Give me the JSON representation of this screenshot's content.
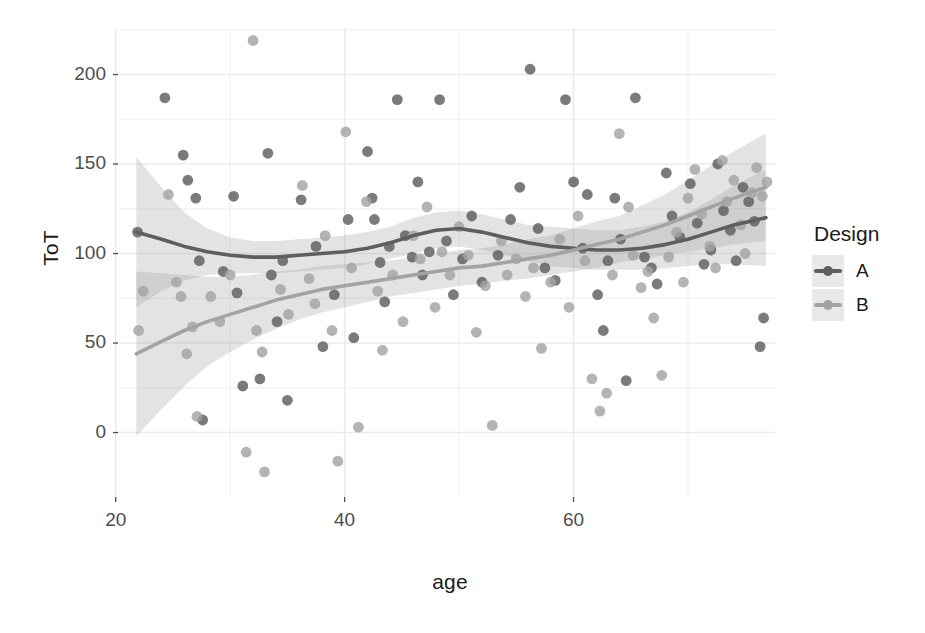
{
  "chart": {
    "type": "scatter",
    "title": "",
    "xlabel": "age",
    "ylabel": "ToT",
    "legend_title": "Design",
    "legend_position": "right",
    "grid": true,
    "panel_background": "#ffffff",
    "grid_color": "#ebebeb",
    "xticks": [
      "20",
      "40",
      "60"
    ],
    "xtick_values": [
      20,
      40,
      60
    ],
    "yticks": [
      "0",
      "50",
      "100",
      "150",
      "200"
    ],
    "ytick_values": [
      0,
      50,
      100,
      150,
      200
    ],
    "xlim": [
      20.2,
      77.6
    ],
    "ylim": [
      -36,
      226
    ],
    "series": [
      {
        "name": "A",
        "color": "#5e5e5e",
        "smooth": [
          [
            21.8,
            112
          ],
          [
            24,
            108
          ],
          [
            26,
            104
          ],
          [
            28,
            101
          ],
          [
            30,
            99
          ],
          [
            32,
            98
          ],
          [
            34,
            98
          ],
          [
            36,
            99
          ],
          [
            38,
            100
          ],
          [
            40,
            101
          ],
          [
            42,
            103
          ],
          [
            44,
            106
          ],
          [
            46,
            110
          ],
          [
            48,
            113
          ],
          [
            50,
            114
          ],
          [
            52,
            112
          ],
          [
            54,
            109
          ],
          [
            56,
            106
          ],
          [
            58,
            104
          ],
          [
            60,
            103
          ],
          [
            62,
            102
          ],
          [
            64,
            102
          ],
          [
            66,
            103
          ],
          [
            68,
            105
          ],
          [
            70,
            108
          ],
          [
            72,
            112
          ],
          [
            74,
            116
          ],
          [
            76.8,
            120
          ]
        ],
        "ci_low": [
          [
            21.8,
            70
          ],
          [
            24,
            79
          ],
          [
            26,
            85
          ],
          [
            28,
            88
          ],
          [
            30,
            89
          ],
          [
            32,
            89
          ],
          [
            34,
            89
          ],
          [
            36,
            90
          ],
          [
            38,
            91
          ],
          [
            40,
            92
          ],
          [
            42,
            94
          ],
          [
            44,
            97
          ],
          [
            46,
            100
          ],
          [
            48,
            103
          ],
          [
            50,
            104
          ],
          [
            52,
            102
          ],
          [
            54,
            99
          ],
          [
            56,
            96
          ],
          [
            58,
            93
          ],
          [
            60,
            92
          ],
          [
            62,
            91
          ],
          [
            64,
            91
          ],
          [
            66,
            91
          ],
          [
            68,
            92
          ],
          [
            70,
            93
          ],
          [
            72,
            94
          ],
          [
            74,
            94
          ],
          [
            76.8,
            93
          ]
        ],
        "ci_high": [
          [
            21.8,
            154
          ],
          [
            24,
            137
          ],
          [
            26,
            123
          ],
          [
            28,
            114
          ],
          [
            30,
            109
          ],
          [
            32,
            107
          ],
          [
            34,
            107
          ],
          [
            36,
            108
          ],
          [
            38,
            109
          ],
          [
            40,
            110
          ],
          [
            42,
            112
          ],
          [
            44,
            115
          ],
          [
            46,
            120
          ],
          [
            48,
            123
          ],
          [
            50,
            124
          ],
          [
            52,
            122
          ],
          [
            54,
            119
          ],
          [
            56,
            116
          ],
          [
            58,
            115
          ],
          [
            60,
            114
          ],
          [
            62,
            113
          ],
          [
            64,
            113
          ],
          [
            66,
            115
          ],
          [
            68,
            118
          ],
          [
            70,
            123
          ],
          [
            72,
            130
          ],
          [
            74,
            138
          ],
          [
            76.8,
            147
          ]
        ]
      },
      {
        "name": "B",
        "color": "#a3a3a3",
        "smooth": [
          [
            21.8,
            44
          ],
          [
            24,
            51
          ],
          [
            26,
            57
          ],
          [
            28,
            62
          ],
          [
            30,
            66
          ],
          [
            32,
            70
          ],
          [
            34,
            74
          ],
          [
            36,
            77
          ],
          [
            38,
            80
          ],
          [
            40,
            82
          ],
          [
            42,
            84
          ],
          [
            44,
            86
          ],
          [
            46,
            88
          ],
          [
            48,
            90
          ],
          [
            50,
            92
          ],
          [
            52,
            93
          ],
          [
            54,
            95
          ],
          [
            56,
            97
          ],
          [
            58,
            99
          ],
          [
            60,
            102
          ],
          [
            62,
            105
          ],
          [
            64,
            108
          ],
          [
            66,
            112
          ],
          [
            68,
            116
          ],
          [
            70,
            121
          ],
          [
            72,
            126
          ],
          [
            74,
            131
          ],
          [
            76.8,
            137
          ]
        ],
        "ci_low": [
          [
            21.8,
            -2
          ],
          [
            24,
            13
          ],
          [
            26,
            26
          ],
          [
            28,
            37
          ],
          [
            30,
            45
          ],
          [
            32,
            52
          ],
          [
            34,
            58
          ],
          [
            36,
            63
          ],
          [
            38,
            67
          ],
          [
            40,
            70
          ],
          [
            42,
            73
          ],
          [
            44,
            76
          ],
          [
            46,
            78
          ],
          [
            48,
            80
          ],
          [
            50,
            82
          ],
          [
            52,
            83
          ],
          [
            54,
            85
          ],
          [
            56,
            86
          ],
          [
            58,
            88
          ],
          [
            60,
            90
          ],
          [
            62,
            92
          ],
          [
            64,
            95
          ],
          [
            66,
            97
          ],
          [
            68,
            99
          ],
          [
            70,
            101
          ],
          [
            72,
            103
          ],
          [
            74,
            105
          ],
          [
            76.8,
            107
          ]
        ],
        "ci_high": [
          [
            21.8,
            90
          ],
          [
            24,
            89
          ],
          [
            26,
            88
          ],
          [
            28,
            87
          ],
          [
            30,
            87
          ],
          [
            32,
            88
          ],
          [
            34,
            90
          ],
          [
            36,
            91
          ],
          [
            38,
            93
          ],
          [
            40,
            94
          ],
          [
            42,
            95
          ],
          [
            44,
            96
          ],
          [
            46,
            98
          ],
          [
            48,
            100
          ],
          [
            50,
            102
          ],
          [
            52,
            103
          ],
          [
            54,
            105
          ],
          [
            56,
            108
          ],
          [
            58,
            110
          ],
          [
            60,
            114
          ],
          [
            62,
            118
          ],
          [
            64,
            121
          ],
          [
            66,
            127
          ],
          [
            68,
            133
          ],
          [
            70,
            141
          ],
          [
            72,
            149
          ],
          [
            74,
            157
          ],
          [
            76.8,
            167
          ]
        ]
      }
    ],
    "points_A": [
      [
        21.9,
        112
      ],
      [
        24.3,
        187
      ],
      [
        25.9,
        155
      ],
      [
        26.3,
        141
      ],
      [
        27.0,
        131
      ],
      [
        27.3,
        96
      ],
      [
        27.6,
        7
      ],
      [
        29.4,
        90
      ],
      [
        30.3,
        132
      ],
      [
        30.6,
        78
      ],
      [
        31.1,
        26
      ],
      [
        32.6,
        30
      ],
      [
        33.3,
        156
      ],
      [
        33.6,
        88
      ],
      [
        34.1,
        62
      ],
      [
        34.6,
        96
      ],
      [
        35.0,
        18
      ],
      [
        36.2,
        130
      ],
      [
        37.5,
        104
      ],
      [
        38.1,
        48
      ],
      [
        39.1,
        77
      ],
      [
        40.3,
        119
      ],
      [
        40.8,
        53
      ],
      [
        42.0,
        157
      ],
      [
        42.4,
        131
      ],
      [
        42.6,
        119
      ],
      [
        43.1,
        95
      ],
      [
        43.5,
        73
      ],
      [
        43.9,
        104
      ],
      [
        44.6,
        186
      ],
      [
        45.3,
        110
      ],
      [
        45.9,
        98
      ],
      [
        46.4,
        140
      ],
      [
        46.8,
        88
      ],
      [
        47.4,
        101
      ],
      [
        48.3,
        186
      ],
      [
        48.9,
        107
      ],
      [
        49.5,
        77
      ],
      [
        50.3,
        97
      ],
      [
        51.1,
        121
      ],
      [
        52.0,
        84
      ],
      [
        53.4,
        99
      ],
      [
        54.5,
        119
      ],
      [
        55.3,
        137
      ],
      [
        56.2,
        203
      ],
      [
        56.9,
        114
      ],
      [
        57.5,
        92
      ],
      [
        58.4,
        85
      ],
      [
        59.3,
        186
      ],
      [
        60.0,
        140
      ],
      [
        60.8,
        103
      ],
      [
        61.2,
        133
      ],
      [
        62.1,
        77
      ],
      [
        62.6,
        57
      ],
      [
        63.0,
        96
      ],
      [
        63.6,
        131
      ],
      [
        64.1,
        108
      ],
      [
        64.6,
        29
      ],
      [
        65.4,
        187
      ],
      [
        66.2,
        98
      ],
      [
        66.8,
        92
      ],
      [
        67.3,
        83
      ],
      [
        68.1,
        145
      ],
      [
        68.6,
        121
      ],
      [
        69.3,
        109
      ],
      [
        70.2,
        139
      ],
      [
        70.8,
        117
      ],
      [
        71.4,
        94
      ],
      [
        72.0,
        102
      ],
      [
        72.6,
        150
      ],
      [
        73.1,
        124
      ],
      [
        73.7,
        113
      ],
      [
        74.2,
        96
      ],
      [
        74.8,
        137
      ],
      [
        75.3,
        129
      ],
      [
        75.8,
        118
      ],
      [
        76.3,
        48
      ],
      [
        76.6,
        64
      ]
    ],
    "points_B": [
      [
        22.0,
        57
      ],
      [
        22.4,
        79
      ],
      [
        24.6,
        133
      ],
      [
        25.3,
        84
      ],
      [
        25.7,
        76
      ],
      [
        26.2,
        44
      ],
      [
        26.7,
        59
      ],
      [
        27.1,
        9
      ],
      [
        28.3,
        76
      ],
      [
        29.1,
        62
      ],
      [
        30.0,
        88
      ],
      [
        31.4,
        -11
      ],
      [
        32.0,
        219
      ],
      [
        32.3,
        57
      ],
      [
        32.8,
        45
      ],
      [
        33.0,
        -22
      ],
      [
        34.4,
        80
      ],
      [
        35.1,
        66
      ],
      [
        36.3,
        138
      ],
      [
        36.9,
        86
      ],
      [
        37.4,
        72
      ],
      [
        38.3,
        110
      ],
      [
        38.9,
        57
      ],
      [
        39.4,
        -16
      ],
      [
        40.1,
        168
      ],
      [
        40.6,
        92
      ],
      [
        41.2,
        3
      ],
      [
        41.9,
        129
      ],
      [
        42.9,
        79
      ],
      [
        43.3,
        46
      ],
      [
        44.2,
        88
      ],
      [
        45.1,
        62
      ],
      [
        46.0,
        110
      ],
      [
        46.6,
        97
      ],
      [
        47.2,
        126
      ],
      [
        47.9,
        70
      ],
      [
        48.5,
        101
      ],
      [
        49.2,
        88
      ],
      [
        50.0,
        115
      ],
      [
        50.8,
        99
      ],
      [
        51.5,
        56
      ],
      [
        52.3,
        82
      ],
      [
        52.9,
        4
      ],
      [
        53.7,
        107
      ],
      [
        54.2,
        88
      ],
      [
        55.0,
        97
      ],
      [
        55.8,
        76
      ],
      [
        56.5,
        92
      ],
      [
        57.2,
        47
      ],
      [
        58.0,
        84
      ],
      [
        58.8,
        108
      ],
      [
        59.6,
        70
      ],
      [
        60.4,
        121
      ],
      [
        61.0,
        96
      ],
      [
        61.6,
        30
      ],
      [
        62.3,
        12
      ],
      [
        62.9,
        22
      ],
      [
        63.4,
        88
      ],
      [
        64.0,
        167
      ],
      [
        64.8,
        126
      ],
      [
        65.2,
        99
      ],
      [
        65.9,
        81
      ],
      [
        66.5,
        90
      ],
      [
        67.0,
        64
      ],
      [
        67.7,
        32
      ],
      [
        68.3,
        98
      ],
      [
        69.0,
        112
      ],
      [
        69.6,
        84
      ],
      [
        70.0,
        131
      ],
      [
        70.6,
        147
      ],
      [
        71.2,
        122
      ],
      [
        71.9,
        104
      ],
      [
        72.4,
        92
      ],
      [
        73.0,
        152
      ],
      [
        73.4,
        129
      ],
      [
        74.0,
        141
      ],
      [
        74.6,
        116
      ],
      [
        75.0,
        100
      ],
      [
        75.6,
        134
      ],
      [
        76.0,
        148
      ],
      [
        76.5,
        132
      ],
      [
        76.9,
        140
      ]
    ]
  }
}
